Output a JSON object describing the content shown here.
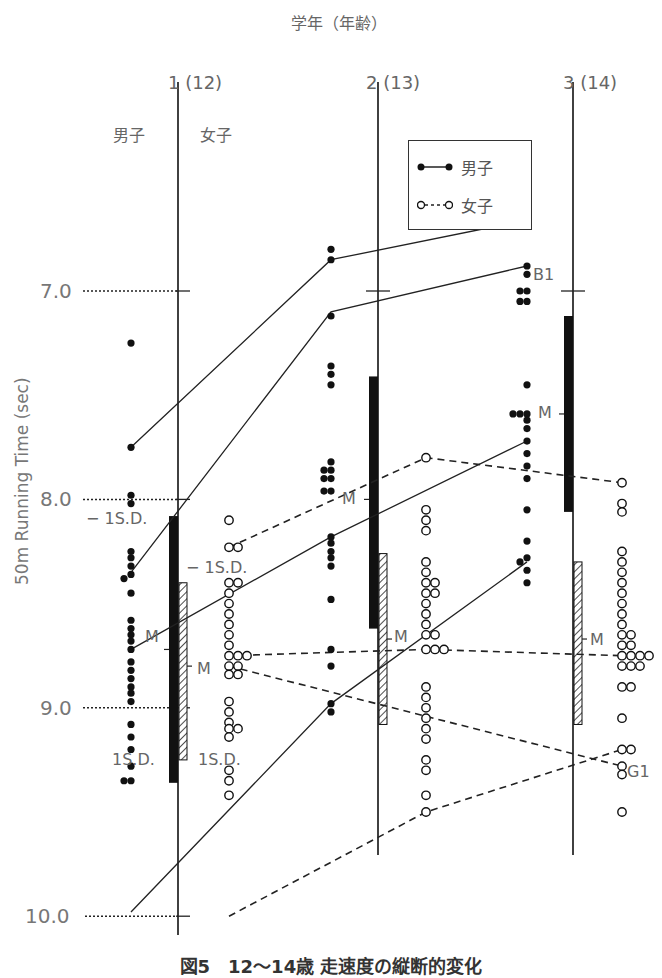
{
  "figure": {
    "top_axis_title": "学年（年齢）",
    "grades": [
      {
        "label": "1 (12)",
        "x": 178
      },
      {
        "label": "2 (13)",
        "x": 378
      },
      {
        "label": "3 (14)",
        "x": 573
      }
    ],
    "sex_headers": {
      "male": "男子",
      "female": "女子"
    },
    "y_axis_label": "50m Running Time (sec)",
    "y_ticks": [
      "7.0",
      "8.0",
      "9.0",
      "10.0"
    ],
    "legend": {
      "male": "男子",
      "female": "女子"
    },
    "annotations": {
      "minus_sd": "− 1S.D.",
      "plus_sd": "1S.D.",
      "mean": "M",
      "b1": "B1",
      "g1": "G1"
    },
    "caption": "図5　12〜14歳 走速度の縦断的変化"
  },
  "chart_data": {
    "type": "scatter",
    "xlabel": "学年（年齢）",
    "ylabel": "50m Running Time (sec)",
    "categories": [
      "1 (12)",
      "2 (13)",
      "3 (14)"
    ],
    "ylim": [
      6.5,
      10.1
    ],
    "y_inverted": true,
    "y_ticks": [
      7.0,
      8.0,
      9.0,
      10.0
    ],
    "grid": "dotted reference lines at 7.0, 8.0, 9.0, 10.0 (left of grade 1 axis)",
    "legend": [
      {
        "name": "男子",
        "marker": "filled circle",
        "line": "solid"
      },
      {
        "name": "女子",
        "marker": "open circle",
        "line": "dashed"
      }
    ],
    "summary_bars": [
      {
        "grade": "1 (12)",
        "sex": "男子",
        "mean": 8.72,
        "minus_1sd": 8.08,
        "plus_1sd": 9.36,
        "style": "solid black"
      },
      {
        "grade": "1 (12)",
        "sex": "女子",
        "mean": 8.8,
        "minus_1sd": 8.4,
        "plus_1sd": 9.25,
        "style": "hatched"
      },
      {
        "grade": "2 (13)",
        "sex": "男子",
        "mean": 8.0,
        "minus_1sd": 7.41,
        "plus_1sd": 8.62,
        "style": "solid black"
      },
      {
        "grade": "2 (13)",
        "sex": "女子",
        "mean": 8.67,
        "minus_1sd": 8.26,
        "plus_1sd": 9.08,
        "style": "hatched"
      },
      {
        "grade": "3 (14)",
        "sex": "男子",
        "mean": 7.59,
        "minus_1sd": 7.12,
        "plus_1sd": 8.06,
        "style": "solid black"
      },
      {
        "grade": "3 (14)",
        "sex": "女子",
        "mean": 8.67,
        "minus_1sd": 8.3,
        "plus_1sd": 9.08,
        "style": "hatched"
      }
    ],
    "scatter": {
      "男子": {
        "1 (12)": [
          7.25,
          7.75,
          7.98,
          8.02,
          8.25,
          8.28,
          8.32,
          8.36,
          8.38,
          8.45,
          8.58,
          8.62,
          8.65,
          8.68,
          8.72,
          8.78,
          8.82,
          8.86,
          8.9,
          8.93,
          8.97,
          9.08,
          9.14,
          9.2,
          9.28,
          9.35,
          9.35
        ],
        "2 (13)": [
          6.8,
          6.85,
          7.12,
          7.36,
          7.4,
          7.45,
          7.82,
          7.86,
          7.86,
          7.9,
          7.9,
          7.96,
          7.96,
          8.18,
          8.21,
          8.25,
          8.28,
          8.32,
          8.48,
          8.72,
          8.8,
          8.98,
          9.02
        ],
        "3 (14)": [
          6.66,
          6.88,
          6.92,
          7.0,
          7.0,
          7.05,
          7.05,
          7.45,
          7.59,
          7.59,
          7.59,
          7.62,
          7.66,
          7.72,
          7.78,
          7.84,
          7.9,
          8.05,
          8.2,
          8.28,
          8.3,
          8.34,
          8.4
        ]
      },
      "女子": {
        "1 (12)": [
          8.1,
          8.23,
          8.23,
          8.4,
          8.4,
          8.45,
          8.5,
          8.55,
          8.6,
          8.65,
          8.7,
          8.75,
          8.75,
          8.75,
          8.8,
          8.8,
          8.84,
          8.84,
          8.97,
          9.02,
          9.07,
          9.1,
          9.1,
          9.14,
          9.3,
          9.35,
          9.42
        ],
        "2 (13)": [
          7.8,
          8.05,
          8.1,
          8.15,
          8.3,
          8.35,
          8.4,
          8.4,
          8.45,
          8.45,
          8.5,
          8.55,
          8.6,
          8.65,
          8.65,
          8.72,
          8.72,
          8.72,
          8.9,
          8.95,
          9.0,
          9.05,
          9.1,
          9.15,
          9.25,
          9.3,
          9.42,
          9.5
        ],
        "3 (14)": [
          7.92,
          8.02,
          8.06,
          8.25,
          8.3,
          8.35,
          8.4,
          8.45,
          8.5,
          8.55,
          8.6,
          8.65,
          8.65,
          8.7,
          8.7,
          8.75,
          8.75,
          8.75,
          8.75,
          8.8,
          8.8,
          8.8,
          8.9,
          8.9,
          9.05,
          9.2,
          9.2,
          9.28,
          9.32,
          9.5
        ]
      }
    },
    "series": [
      {
        "name": "男子 B1",
        "sex": "男子",
        "label": "B1",
        "values": [
          8.35,
          7.1,
          6.88
        ]
      },
      {
        "name": "男子 (upper)",
        "sex": "男子",
        "values": [
          7.75,
          6.85,
          6.66
        ]
      },
      {
        "name": "男子 (mid)",
        "sex": "男子",
        "values": [
          8.72,
          8.18,
          7.72
        ]
      },
      {
        "name": "男子 (low)",
        "sex": "男子",
        "values": [
          9.98,
          8.98,
          8.3
        ]
      },
      {
        "name": "女子 (upper)",
        "sex": "女子",
        "values": [
          8.23,
          7.8,
          7.92
        ]
      },
      {
        "name": "女子 (mid)",
        "sex": "女子",
        "values": [
          8.75,
          8.72,
          8.75
        ]
      },
      {
        "name": "女子 G1",
        "sex": "女子",
        "label": "G1",
        "values": [
          8.8,
          null,
          9.28
        ]
      },
      {
        "name": "女子 (low)",
        "sex": "女子",
        "values": [
          10.0,
          9.5,
          9.2
        ]
      }
    ]
  }
}
